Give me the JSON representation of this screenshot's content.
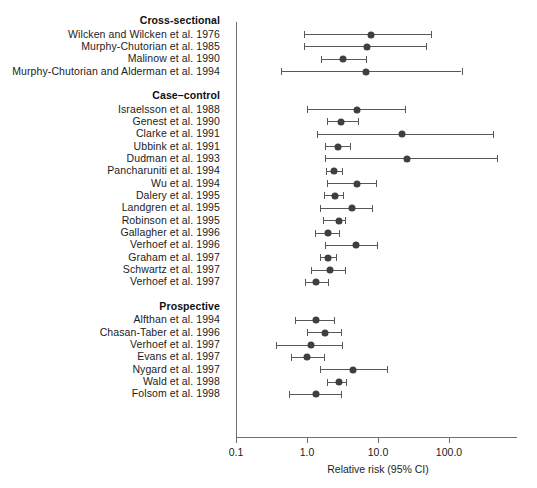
{
  "chart_data": {
    "type": "scatter",
    "plot_kind": "forest-plot",
    "title": "",
    "xlabel": "Relative risk (95% CI)",
    "ylabel": "",
    "xscale": "log",
    "xlim": [
      0.1,
      300
    ],
    "xticks": [
      0.1,
      1.0,
      10.0,
      100.0
    ],
    "xticklabels": [
      "0.1",
      "1.0",
      "10.0",
      "100.0"
    ],
    "grid": false,
    "legend": "none",
    "groups": [
      {
        "name": "Cross-sectional",
        "studies": [
          {
            "label": "Wilcken and Wilcken et al. 1976",
            "rr": 8.0,
            "lo": 0.9,
            "hi": 55.0
          },
          {
            "label": "Murphy-Chutorian et al. 1985",
            "rr": 7.0,
            "lo": 0.9,
            "hi": 48.0
          },
          {
            "label": "Malinow et al. 1990",
            "rr": 3.2,
            "lo": 1.6,
            "hi": 6.8
          },
          {
            "label": "Murphy-Chutorian and Alderman et al. 1994",
            "rr": 6.8,
            "lo": 0.43,
            "hi": 150.0
          }
        ]
      },
      {
        "name": "Case–control",
        "studies": [
          {
            "label": "Israelsson et al. 1988",
            "rr": 5.0,
            "lo": 1.0,
            "hi": 24.0
          },
          {
            "label": "Genest et al. 1990",
            "rr": 3.0,
            "lo": 1.9,
            "hi": 5.2
          },
          {
            "label": "Clarke et al. 1991",
            "rr": 22.0,
            "lo": 1.4,
            "hi": 410.0
          },
          {
            "label": "Ubbink et al. 1991",
            "rr": 2.7,
            "lo": 1.8,
            "hi": 4.0
          },
          {
            "label": "Dudman et al. 1993",
            "rr": 26.0,
            "lo": 1.8,
            "hi": 480.0
          },
          {
            "label": "Pancharuniti et al. 1994",
            "rr": 2.4,
            "lo": 1.85,
            "hi": 3.1
          },
          {
            "label": "Wu et al. 1994",
            "rr": 5.0,
            "lo": 1.9,
            "hi": 9.4
          },
          {
            "label": "Dalery et al. 1995",
            "rr": 2.5,
            "lo": 1.75,
            "hi": 3.2
          },
          {
            "label": "Landgren et al. 1995",
            "rr": 4.3,
            "lo": 1.5,
            "hi": 8.2
          },
          {
            "label": "Robinson et al. 1995",
            "rr": 2.8,
            "lo": 1.7,
            "hi": 3.4
          },
          {
            "label": "Gallagher et al. 1996",
            "rr": 2.0,
            "lo": 1.3,
            "hi": 2.8
          },
          {
            "label": "Verhoef et al. 1996",
            "rr": 4.9,
            "lo": 1.8,
            "hi": 9.6
          },
          {
            "label": "Graham et al. 1997",
            "rr": 2.0,
            "lo": 1.5,
            "hi": 2.6
          },
          {
            "label": "Schwartz et al. 1997",
            "rr": 2.1,
            "lo": 1.15,
            "hi": 3.4
          },
          {
            "label": "Verhoef et al. 1997",
            "rr": 1.35,
            "lo": 0.95,
            "hi": 1.95
          }
        ]
      },
      {
        "name": "Prospective",
        "studies": [
          {
            "label": "Alfthan et al. 1994",
            "rr": 1.35,
            "lo": 0.67,
            "hi": 2.4
          },
          {
            "label": "Chasan-Taber et al. 1996",
            "rr": 1.8,
            "lo": 1.0,
            "hi": 3.0
          },
          {
            "label": "Verhoef et al. 1997",
            "rr": 1.15,
            "lo": 0.37,
            "hi": 3.1
          },
          {
            "label": "Evans et al. 1997",
            "rr": 1.0,
            "lo": 0.6,
            "hi": 1.75
          },
          {
            "label": "Nygard et al. 1997",
            "rr": 4.4,
            "lo": 1.5,
            "hi": 13.5
          },
          {
            "label": "Wald et al. 1998",
            "rr": 2.8,
            "lo": 1.9,
            "hi": 3.6
          },
          {
            "label": "Folsom et al. 1998",
            "rr": 1.35,
            "lo": 0.55,
            "hi": 3.0
          }
        ]
      }
    ]
  },
  "style": {
    "point_color": "#3f3f3f",
    "line_color": "#585858",
    "axis_color": "#6f6f6f",
    "text_color": "#1c1c1c",
    "background": "#ffffff"
  }
}
